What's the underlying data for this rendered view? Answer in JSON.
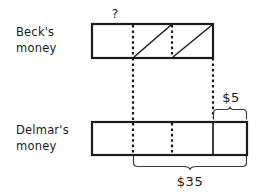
{
  "diagram": {
    "title_visible": false,
    "type": "tape-diagram",
    "colors": {
      "ink": "#1c1c1c",
      "brace": "#3a3a3a",
      "background": "#ffffff"
    },
    "rows": [
      {
        "id": "becks",
        "label_line1": "Beck's",
        "label_line2": "money",
        "unknown_marker": "?",
        "bar": {
          "x": 92,
          "y": 24,
          "width": 121,
          "height": 34,
          "segments": 3,
          "divider_positions": [
            133,
            172
          ],
          "divider_style": "dotted",
          "hatched_segments": [
            2,
            3
          ]
        }
      },
      {
        "id": "delmars",
        "label_line1": "Delmar's",
        "label_line2": "money",
        "bar": {
          "x": 92,
          "y": 122,
          "width": 155,
          "height": 33,
          "segments": 4,
          "divider_positions": [
            133,
            172,
            213
          ],
          "divider_style": "dotted-dotted-solid"
        }
      }
    ],
    "connectors": [
      {
        "x": 133,
        "from_y": 58,
        "to_y": 122,
        "style": "dotted"
      },
      {
        "x": 213,
        "from_y": 58,
        "to_y": 122,
        "style": "dotted"
      }
    ],
    "braces": [
      {
        "id": "five-dollar-brace",
        "label": "$5",
        "orientation": "up",
        "from_x": 213,
        "to_x": 247,
        "y": 118,
        "label_x": 231,
        "label_y": 101
      },
      {
        "id": "thirtyfive-dollar-brace",
        "label": "$35",
        "orientation": "down",
        "from_x": 133,
        "to_x": 247,
        "y": 159,
        "label_x": 190,
        "label_y": 182
      }
    ]
  }
}
